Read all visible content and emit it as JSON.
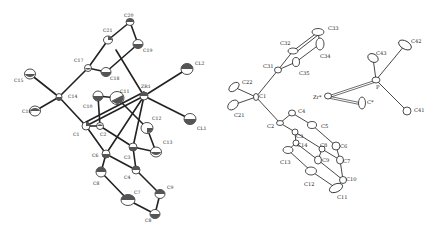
{
  "figure": {
    "panels": [
      {
        "id": "left",
        "description": "ORTEP view of zirconium complex with Cl ligands and silyl-substituted ring",
        "atoms": [
          {
            "label": "C20",
            "x": 130,
            "y": 22,
            "lx": 124,
            "ly": 17
          },
          {
            "label": "C21",
            "x": 108,
            "y": 40,
            "lx": 103,
            "ly": 32
          },
          {
            "label": "C19",
            "x": 138,
            "y": 44,
            "lx": 143,
            "ly": 52
          },
          {
            "label": "C17",
            "x": 88,
            "y": 68,
            "lx": 74,
            "ly": 62
          },
          {
            "label": "C18",
            "x": 106,
            "y": 72,
            "lx": 110,
            "ly": 80
          },
          {
            "label": "ZR1",
            "x": 144,
            "y": 96,
            "lx": 141,
            "ly": 88
          },
          {
            "label": "CL2",
            "x": 187,
            "y": 69,
            "lx": 195,
            "ly": 65
          },
          {
            "label": "CL1",
            "x": 190,
            "y": 119,
            "lx": 197,
            "ly": 130
          },
          {
            "label": "C15",
            "x": 30,
            "y": 74,
            "lx": 14,
            "ly": 82
          },
          {
            "label": "C14",
            "x": 59,
            "y": 97,
            "lx": 68,
            "ly": 98
          },
          {
            "label": "C16",
            "x": 35,
            "y": 111,
            "lx": 22,
            "ly": 113
          },
          {
            "label": "C10",
            "x": 98,
            "y": 96,
            "lx": 83,
            "ly": 108
          },
          {
            "label": "C11",
            "x": 117,
            "y": 98,
            "lx": 120,
            "ly": 93
          },
          {
            "label": "C12",
            "x": 147,
            "y": 128,
            "lx": 152,
            "ly": 120
          },
          {
            "label": "C13",
            "x": 156,
            "y": 152,
            "lx": 163,
            "ly": 144
          },
          {
            "label": "C1",
            "x": 86,
            "y": 126,
            "lx": 73,
            "ly": 136
          },
          {
            "label": "C2",
            "x": 100,
            "y": 126,
            "lx": 100,
            "ly": 136
          },
          {
            "label": "C3",
            "x": 133,
            "y": 147,
            "lx": 124,
            "ly": 159
          },
          {
            "label": "C4",
            "x": 136,
            "y": 170,
            "lx": 124,
            "ly": 179
          },
          {
            "label": "C6",
            "x": 106,
            "y": 154,
            "lx": 92,
            "ly": 157
          },
          {
            "label": "C8",
            "x": 101,
            "y": 172,
            "lx": 93,
            "ly": 185
          },
          {
            "label": "C7",
            "x": 128,
            "y": 200,
            "lx": 134,
            "ly": 194
          },
          {
            "label": "C9",
            "x": 160,
            "y": 194,
            "lx": 167,
            "ly": 189
          },
          {
            "label": "C8b",
            "display": "C8",
            "x": 155,
            "y": 214,
            "lx": 145,
            "ly": 222
          }
        ]
      },
      {
        "id": "right",
        "description": "ORTEP view of molecule with phenyl rings and Zr–P fragment",
        "atoms": [
          {
            "label": "C33",
            "x": 318,
            "y": 32,
            "lx": 328,
            "ly": 30
          },
          {
            "label": "C32",
            "x": 293,
            "y": 51,
            "lx": 280,
            "ly": 45
          },
          {
            "label": "C34",
            "x": 320,
            "y": 44,
            "lx": 320,
            "ly": 58
          },
          {
            "label": "C31",
            "x": 278,
            "y": 70,
            "lx": 263,
            "ly": 68
          },
          {
            "label": "C35",
            "x": 296,
            "y": 62,
            "lx": 299,
            "ly": 75
          },
          {
            "label": "C22",
            "x": 234,
            "y": 87,
            "lx": 242,
            "ly": 84
          },
          {
            "label": "C1",
            "x": 256,
            "y": 97,
            "lx": 259,
            "ly": 98
          },
          {
            "label": "C21",
            "x": 233,
            "y": 105,
            "lx": 234,
            "ly": 117
          },
          {
            "label": "C42",
            "x": 405,
            "y": 45,
            "lx": 411,
            "ly": 43
          },
          {
            "label": "C43",
            "x": 373,
            "y": 58,
            "lx": 376,
            "ly": 55
          },
          {
            "label": "P",
            "x": 376,
            "y": 80,
            "lx": 376,
            "ly": 89
          },
          {
            "label": "Zr*",
            "x": 328,
            "y": 96,
            "lx": 313,
            "ly": 99
          },
          {
            "label": "C*",
            "x": 362,
            "y": 103,
            "lx": 367,
            "ly": 104
          },
          {
            "label": "C41",
            "x": 407,
            "y": 111,
            "lx": 414,
            "ly": 112
          },
          {
            "label": "C4",
            "x": 292,
            "y": 113,
            "lx": 298,
            "ly": 113
          },
          {
            "label": "C2",
            "x": 280,
            "y": 123,
            "lx": 267,
            "ly": 128
          },
          {
            "label": "C5",
            "x": 312,
            "y": 125,
            "lx": 321,
            "ly": 128
          },
          {
            "label": "C3",
            "x": 295,
            "y": 132,
            "lx": 296,
            "ly": 138
          },
          {
            "label": "C14",
            "x": 296,
            "y": 143,
            "lx": 297,
            "ly": 147
          },
          {
            "label": "C13",
            "x": 288,
            "y": 150,
            "lx": 280,
            "ly": 164
          },
          {
            "label": "C8",
            "x": 322,
            "y": 149,
            "lx": 320,
            "ly": 147
          },
          {
            "label": "C6",
            "x": 336,
            "y": 146,
            "lx": 340,
            "ly": 148
          },
          {
            "label": "C9",
            "x": 318,
            "y": 160,
            "lx": 322,
            "ly": 162
          },
          {
            "label": "C7",
            "x": 340,
            "y": 160,
            "lx": 343,
            "ly": 163
          },
          {
            "label": "C12",
            "x": 311,
            "y": 171,
            "lx": 304,
            "ly": 186
          },
          {
            "label": "C10",
            "x": 343,
            "y": 180,
            "lx": 346,
            "ly": 181
          },
          {
            "label": "C11",
            "x": 336,
            "y": 188,
            "lx": 337,
            "ly": 199
          }
        ]
      }
    ]
  }
}
